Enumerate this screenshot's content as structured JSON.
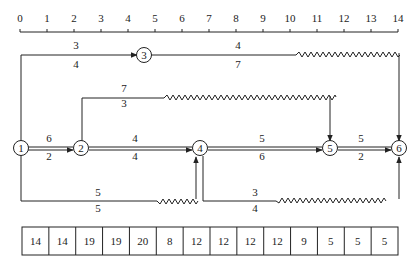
{
  "timescale": {
    "ticks": [
      "0",
      "1",
      "2",
      "3",
      "4",
      "5",
      "6",
      "7",
      "8",
      "9",
      "10",
      "11",
      "12",
      "13",
      "14"
    ]
  },
  "nodes": [
    {
      "id": "1",
      "label": "1"
    },
    {
      "id": "2",
      "label": "2"
    },
    {
      "id": "3",
      "label": "3"
    },
    {
      "id": "4",
      "label": "4"
    },
    {
      "id": "5",
      "label": "5"
    },
    {
      "id": "6",
      "label": "6"
    }
  ],
  "activities": {
    "a1_3": {
      "resource": "3",
      "duration": "4"
    },
    "a3_6": {
      "resource": "4",
      "duration": "7"
    },
    "a2_5": {
      "resource": "7",
      "duration": "3"
    },
    "a1_2": {
      "resource": "6",
      "duration": "2"
    },
    "a2_4": {
      "resource": "4",
      "duration": "4"
    },
    "a4_5": {
      "resource": "5",
      "duration": "6"
    },
    "a5_6": {
      "resource": "5",
      "duration": "2"
    },
    "a1_4": {
      "resource": "5",
      "duration": "5"
    },
    "a4_6": {
      "resource": "3",
      "duration": "4"
    }
  },
  "resource_table": {
    "values": [
      "14",
      "14",
      "19",
      "19",
      "20",
      "8",
      "12",
      "12",
      "12",
      "12",
      "9",
      "5",
      "5",
      "5"
    ]
  }
}
